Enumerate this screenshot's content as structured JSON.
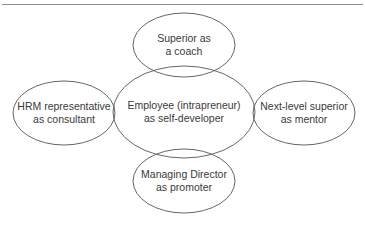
{
  "diagram": {
    "center": {
      "line1": "Employee (intrapreneur)",
      "line2": "as self-developer"
    },
    "nodes": [
      {
        "id": "top",
        "line1": "Superior as",
        "line2": "a coach"
      },
      {
        "id": "left",
        "line1": "HRM representative",
        "line2": "as consultant"
      },
      {
        "id": "right",
        "line1": "Next-level superior",
        "line2": "as mentor"
      },
      {
        "id": "bottom",
        "line1": "Managing Director",
        "line2": "as promoter"
      }
    ],
    "colors": {
      "stroke": "#555555",
      "text": "#3a3a3a",
      "rule": "#8a8a8a"
    }
  }
}
